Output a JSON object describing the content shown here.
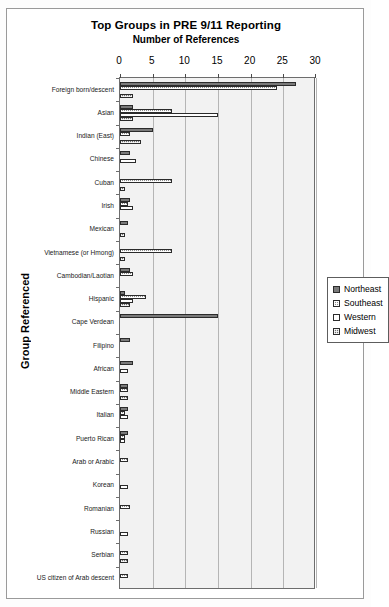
{
  "chart_data": {
    "type": "bar",
    "orientation": "horizontal",
    "title": "Top Groups in PRE 9/11 Reporting",
    "subtitle": "Number of References",
    "xlabel": "",
    "ylabel": "Group Referenced",
    "xlim": [
      0,
      30
    ],
    "xticks": [
      0,
      5,
      10,
      15,
      20,
      25,
      30
    ],
    "grid": true,
    "legend_position": "right",
    "categories": [
      "Foreign born/descent",
      "Asian",
      "Indian (East)",
      "Chinese",
      "Cuban",
      "Irish",
      "Mexican",
      "Vietnamese (or Hmong)",
      "Cambodian/Laotian",
      "Hispanic",
      "Cape Verdean",
      "Filipino",
      "African",
      "Middle Eastern",
      "Italian",
      "Puerto Rican",
      "Arab or Arabic",
      "Korean",
      "Romanian",
      "Russian",
      "Serbian",
      "US citizen of Arab descent"
    ],
    "series": [
      {
        "name": "Northeast",
        "values": [
          27,
          2,
          5,
          1.6,
          0,
          1.6,
          1.2,
          0,
          1.6,
          0.8,
          15,
          1.6,
          2,
          1.2,
          1.2,
          1.2,
          0,
          0,
          0,
          0,
          0,
          0
        ]
      },
      {
        "name": "Southeast",
        "values": [
          24,
          8,
          1.6,
          0,
          8,
          1.2,
          0,
          8,
          2,
          4,
          0,
          0,
          0,
          1.2,
          0.8,
          0.8,
          1.2,
          0,
          1.6,
          0,
          1.2,
          1.2
        ]
      },
      {
        "name": "Western",
        "values": [
          0,
          15,
          0,
          2.4,
          0,
          2,
          0,
          0,
          0,
          2,
          0,
          0,
          1.2,
          0,
          1.2,
          0.8,
          0,
          1.2,
          0,
          1.2,
          0,
          0
        ]
      },
      {
        "name": "Midwest",
        "values": [
          2,
          2,
          3.2,
          0,
          0.8,
          0,
          0.8,
          0.8,
          0,
          1.6,
          0,
          0,
          0,
          1.2,
          0,
          0,
          0,
          0,
          0,
          0,
          1.2,
          0
        ]
      }
    ]
  },
  "legend": {
    "items": [
      "Northeast",
      "Southeast",
      "Western",
      "Midwest"
    ]
  },
  "colors": {
    "series_northeast": "#7a7a7a",
    "series_southeast": "#8d8d8d",
    "series_western": "#ffffff",
    "series_midwest": "#6f6f6f",
    "plot_background": "#f2f2f2",
    "gridline": "#b5b5b5",
    "axis": "#6d6d6d"
  }
}
